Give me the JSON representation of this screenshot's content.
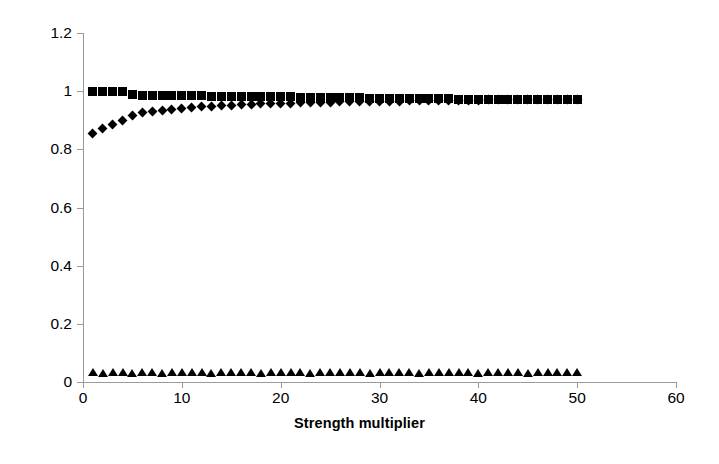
{
  "chart_data": {
    "type": "scatter",
    "title": "",
    "xlabel": "Strength multiplier",
    "ylabel": "",
    "xlim": [
      0,
      60
    ],
    "ylim": [
      0,
      1.2
    ],
    "xticks": [
      "0",
      "10",
      "20",
      "30",
      "40",
      "50",
      "60"
    ],
    "yticks": [
      "0",
      "0.2",
      "0.4",
      "0.6",
      "0.8",
      "1",
      "1.2"
    ],
    "grid": false,
    "legend": "none",
    "marker_color": "#000000",
    "axis_color": "#9a9a9a",
    "x": [
      1,
      2,
      3,
      4,
      5,
      6,
      7,
      8,
      9,
      10,
      11,
      12,
      13,
      14,
      15,
      16,
      17,
      18,
      19,
      20,
      21,
      22,
      23,
      24,
      25,
      26,
      27,
      28,
      29,
      30,
      31,
      32,
      33,
      34,
      35,
      36,
      37,
      38,
      39,
      40,
      41,
      42,
      43,
      44,
      45,
      46,
      47,
      48,
      49,
      50
    ],
    "series": [
      {
        "name": "series-squares",
        "marker": "square",
        "values": [
          1.0,
          1.0,
          1.0,
          1.0,
          0.987,
          0.986,
          0.986,
          0.985,
          0.985,
          0.985,
          0.984,
          0.984,
          0.983,
          0.983,
          0.982,
          0.982,
          0.981,
          0.981,
          0.98,
          0.98,
          0.98,
          0.979,
          0.979,
          0.978,
          0.978,
          0.977,
          0.977,
          0.977,
          0.976,
          0.976,
          0.976,
          0.975,
          0.975,
          0.975,
          0.974,
          0.974,
          0.974,
          0.973,
          0.973,
          0.973,
          0.973,
          0.972,
          0.972,
          0.972,
          0.972,
          0.972,
          0.972,
          0.972,
          0.972,
          0.972
        ]
      },
      {
        "name": "series-diamonds",
        "marker": "diamond",
        "values": [
          0.855,
          0.872,
          0.886,
          0.898,
          0.918,
          0.925,
          0.93,
          0.934,
          0.938,
          0.941,
          0.944,
          0.946,
          0.948,
          0.95,
          0.952,
          0.953,
          0.955,
          0.956,
          0.957,
          0.958,
          0.959,
          0.96,
          0.961,
          0.962,
          0.962,
          0.963,
          0.964,
          0.964,
          0.965,
          0.965,
          0.966,
          0.966,
          0.967,
          0.967,
          0.968,
          0.968,
          0.968,
          0.969,
          0.969,
          0.969,
          0.97,
          0.97,
          0.97,
          0.97,
          0.971,
          0.971,
          0.971,
          0.971,
          0.972,
          0.972
        ]
      },
      {
        "name": "series-triangles",
        "marker": "triangle",
        "values": [
          0.033,
          0.032,
          0.034,
          0.033,
          0.032,
          0.034,
          0.033,
          0.032,
          0.034,
          0.033,
          0.034,
          0.033,
          0.032,
          0.034,
          0.033,
          0.034,
          0.033,
          0.032,
          0.034,
          0.033,
          0.034,
          0.033,
          0.032,
          0.034,
          0.033,
          0.034,
          0.033,
          0.034,
          0.032,
          0.033,
          0.034,
          0.033,
          0.034,
          0.032,
          0.033,
          0.034,
          0.033,
          0.034,
          0.033,
          0.032,
          0.034,
          0.033,
          0.034,
          0.033,
          0.032,
          0.034,
          0.033,
          0.034,
          0.033,
          0.035
        ]
      }
    ]
  }
}
